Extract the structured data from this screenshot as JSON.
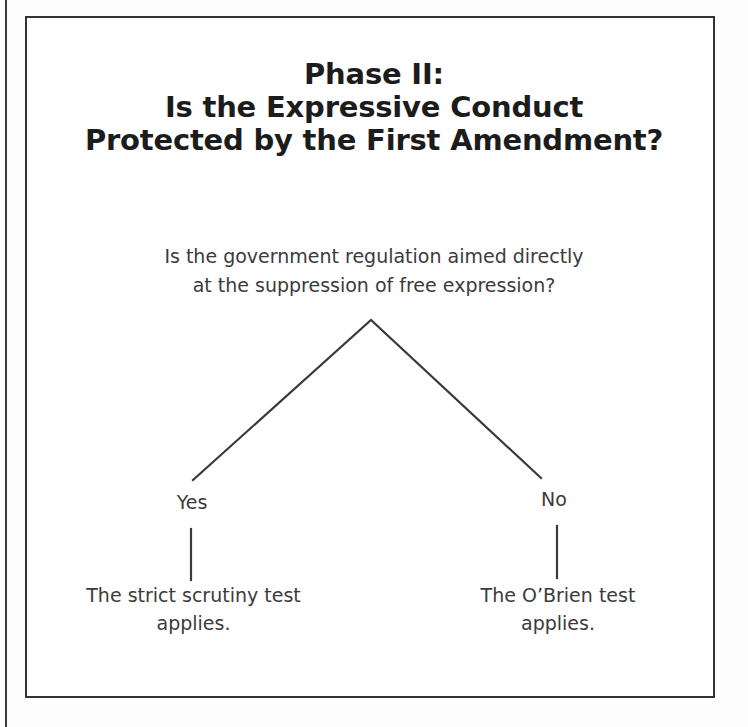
{
  "figure": {
    "title_lines": [
      "Phase II:",
      "Is the Expressive Conduct",
      "Protected by the First Amendment?"
    ],
    "root_question_lines": [
      "Is the government regulation aimed directly",
      "at the suppression of free expression?"
    ],
    "branches": [
      {
        "label": "Yes",
        "outcome_lines": [
          "The strict scrutiny test",
          "applies."
        ]
      },
      {
        "label": "No",
        "outcome_lines": [
          "The O’Brien test",
          "applies."
        ]
      }
    ],
    "colors": {
      "frame": "#333333",
      "connector": "#3a3a3a",
      "title_text": "#1c1c1c",
      "body_text": "#3b3b3b",
      "background": "#ffffff"
    }
  }
}
